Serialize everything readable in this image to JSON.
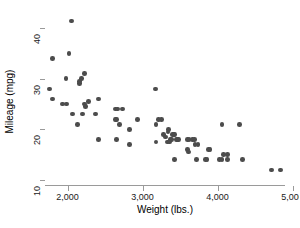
{
  "figure": {
    "clipped_header_text": "",
    "background_color": "#ffffff",
    "marker_color": "#4c4c4c",
    "axis_color": "#9a9a9a"
  },
  "chart_data": {
    "type": "scatter",
    "title": "",
    "xlabel": "Weight (lbs.)",
    "ylabel": "Mileage (mpg)",
    "xlim": [
      1700,
      4900
    ],
    "ylim": [
      9,
      42
    ],
    "xticks": [
      2000,
      3000,
      4000,
      5000
    ],
    "xticklabels": [
      "2,000",
      "3,000",
      "4,000",
      "5,000"
    ],
    "yticks": [
      10,
      20,
      30,
      40
    ],
    "yticklabels": [
      "10",
      "20",
      "30",
      "40"
    ],
    "grid": false,
    "legend": false,
    "n_points": 74,
    "marker": "filled-circle",
    "marker_size": 4.6,
    "series": [
      {
        "name": "Mileage vs Weight",
        "color": "#4c4c4c",
        "points": [
          [
            2050,
            41.4
          ],
          [
            1800,
            34.0
          ],
          [
            2020,
            35.0
          ],
          [
            2230,
            31.0
          ],
          [
            1980,
            30.0
          ],
          [
            2160,
            29.0
          ],
          [
            2160,
            29.5
          ],
          [
            2190,
            30.0
          ],
          [
            1760,
            28.0
          ],
          [
            3170,
            28.0
          ],
          [
            1800,
            26.0
          ],
          [
            2410,
            26.0
          ],
          [
            1930,
            25.0
          ],
          [
            1990,
            25.0
          ],
          [
            2640,
            24.0
          ],
          [
            2670,
            24.0
          ],
          [
            2730,
            24.0
          ],
          [
            2280,
            25.5
          ],
          [
            2230,
            25.0
          ],
          [
            2240,
            24.5
          ],
          [
            2070,
            23.0
          ],
          [
            2200,
            23.0
          ],
          [
            2370,
            23.0
          ],
          [
            2640,
            22.0
          ],
          [
            2650,
            22.0
          ],
          [
            2930,
            22.0
          ],
          [
            3210,
            22.0
          ],
          [
            3250,
            22.0
          ],
          [
            3180,
            21.0
          ],
          [
            2130,
            21.0
          ],
          [
            2690,
            21.0
          ],
          [
            4060,
            21.0
          ],
          [
            4290,
            21.0
          ],
          [
            2830,
            20.0
          ],
          [
            3350,
            20.0
          ],
          [
            3340,
            19.5
          ],
          [
            3400,
            19.0
          ],
          [
            3420,
            19.0
          ],
          [
            3430,
            19.0
          ],
          [
            3280,
            19.0
          ],
          [
            3310,
            18.5
          ],
          [
            3370,
            18.0
          ],
          [
            3390,
            18.0
          ],
          [
            3450,
            18.0
          ],
          [
            3470,
            18.0
          ],
          [
            3480,
            18.0
          ],
          [
            3600,
            18.0
          ],
          [
            3620,
            18.0
          ],
          [
            3670,
            18.0
          ],
          [
            3690,
            18.0
          ],
          [
            2410,
            18.0
          ],
          [
            2650,
            18.0
          ],
          [
            3180,
            17.5
          ],
          [
            3330,
            17.5
          ],
          [
            3360,
            17.5
          ],
          [
            2830,
            17.0
          ],
          [
            3700,
            17.0
          ],
          [
            3740,
            17.0
          ],
          [
            3880,
            16.0
          ],
          [
            3900,
            16.0
          ],
          [
            3600,
            16.0
          ],
          [
            3610,
            15.5
          ],
          [
            4080,
            15.0
          ],
          [
            4130,
            15.0
          ],
          [
            3720,
            14.0
          ],
          [
            3840,
            14.0
          ],
          [
            3860,
            14.0
          ],
          [
            4030,
            14.0
          ],
          [
            4060,
            14.0
          ],
          [
            4130,
            14.0
          ],
          [
            4330,
            14.0
          ],
          [
            3430,
            14.0
          ],
          [
            4720,
            12.0
          ],
          [
            4840,
            12.0
          ]
        ]
      }
    ]
  }
}
